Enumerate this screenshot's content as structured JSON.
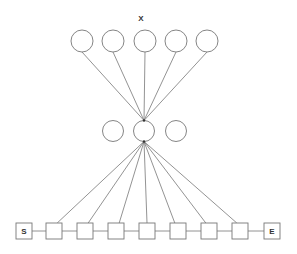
{
  "diagram": {
    "title": "X",
    "colors": {
      "stroke": "#777777",
      "background": "#ffffff",
      "text": "#333333"
    },
    "top_layer": {
      "nodes": [
        {
          "cx": 82,
          "cy": 41
        },
        {
          "cx": 113,
          "cy": 41
        },
        {
          "cx": 145,
          "cy": 41
        },
        {
          "cx": 176,
          "cy": 41
        },
        {
          "cx": 207,
          "cy": 41
        }
      ],
      "radius": 11
    },
    "middle_layer": {
      "nodes": [
        {
          "cx": 113,
          "cy": 131
        },
        {
          "cx": 144,
          "cy": 131
        },
        {
          "cx": 176,
          "cy": 131
        }
      ],
      "radius": 10.5
    },
    "sequence": {
      "start_label": "S",
      "end_label": "E",
      "box_size": 16,
      "y": 223,
      "boxes_x": [
        16,
        46,
        77,
        108,
        139,
        170,
        201,
        232,
        264
      ]
    }
  }
}
